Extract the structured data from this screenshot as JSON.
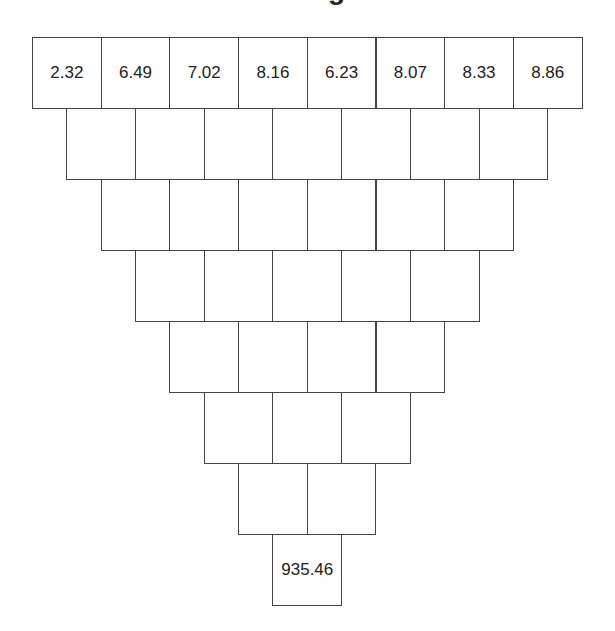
{
  "title_fragment": "g",
  "pyramid": {
    "rows": [
      [
        "2.32",
        "6.49",
        "7.02",
        "8.16",
        "6.23",
        "8.07",
        "8.33",
        "8.86"
      ],
      [
        "",
        "",
        "",
        "",
        "",
        "",
        ""
      ],
      [
        "",
        "",
        "",
        "",
        "",
        ""
      ],
      [
        "",
        "",
        "",
        "",
        ""
      ],
      [
        "",
        "",
        "",
        ""
      ],
      [
        "",
        "",
        ""
      ],
      [
        "",
        ""
      ],
      [
        "935.46"
      ]
    ]
  },
  "layout": {
    "left": 32,
    "top": 37,
    "cell_width": 68.7,
    "row_height": 71,
    "border_color": "#444444"
  }
}
